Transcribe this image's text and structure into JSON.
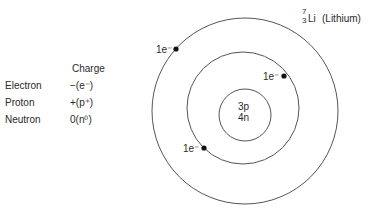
{
  "legend_table": {
    "header": "Charge",
    "rows": [
      {
        "particle": "Electron",
        "charge": "−(e⁻)"
      },
      {
        "particle": "Proton",
        "charge": "+(p⁺)"
      },
      {
        "particle": "Neutron",
        "charge": "0(n⁰)"
      }
    ]
  },
  "element": {
    "mass_number": "7",
    "atomic_number": "3",
    "symbol": "Li",
    "name": "(Lithium)"
  },
  "nucleus": {
    "protons": "3p",
    "neutrons": "4n"
  },
  "electrons": [
    {
      "label": "1e⁻",
      "shell": "outer"
    },
    {
      "label": "1e⁻",
      "shell": "inner"
    },
    {
      "label": "1e⁻",
      "shell": "inner"
    }
  ],
  "colors": {
    "line": "#555555",
    "dot": "#111111",
    "text": "#2a2a2a"
  }
}
